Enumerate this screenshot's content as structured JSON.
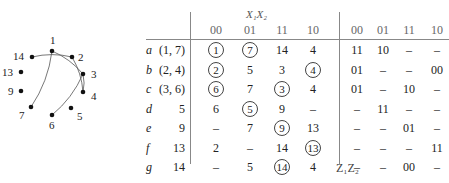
{
  "graph": {
    "nodes": [
      {
        "id": "1",
        "x": 52,
        "y": 51
      },
      {
        "id": "2",
        "x": 72,
        "y": 57
      },
      {
        "id": "3",
        "x": 83,
        "y": 74
      },
      {
        "id": "4",
        "x": 83,
        "y": 92
      },
      {
        "id": "5",
        "x": 71,
        "y": 108
      },
      {
        "id": "6",
        "x": 52,
        "y": 115
      },
      {
        "id": "7",
        "x": 31,
        "y": 107
      },
      {
        "id": "9",
        "x": 21,
        "y": 91
      },
      {
        "id": "13",
        "x": 21,
        "y": 72
      },
      {
        "id": "14",
        "x": 32,
        "y": 57
      }
    ],
    "edges": [
      [
        "1",
        "7"
      ],
      [
        "1",
        "3"
      ],
      [
        "14",
        "2"
      ],
      [
        "2",
        "4"
      ],
      [
        "3",
        "4"
      ],
      [
        "3",
        "6"
      ]
    ]
  },
  "table": {
    "group_header_x": "X₁X₂",
    "group_header_z": "Z₁Z₂",
    "x_columns": [
      "00",
      "01",
      "11",
      "10"
    ],
    "z_columns": [
      "00",
      "01",
      "11",
      "10"
    ],
    "rows": [
      {
        "label": "a",
        "states": "(1, 7)",
        "x": [
          {
            "v": "1",
            "c": true
          },
          {
            "v": "7",
            "c": true
          },
          {
            "v": "14",
            "c": false
          },
          {
            "v": "4",
            "c": false
          }
        ],
        "z": [
          "11",
          "10",
          "–",
          "–"
        ]
      },
      {
        "label": "b",
        "states": "(2, 4)",
        "x": [
          {
            "v": "2",
            "c": true
          },
          {
            "v": "5",
            "c": false
          },
          {
            "v": "3",
            "c": false
          },
          {
            "v": "4",
            "c": true
          }
        ],
        "z": [
          "01",
          "–",
          "–",
          "00"
        ]
      },
      {
        "label": "c",
        "states": "(3, 6)",
        "x": [
          {
            "v": "6",
            "c": true
          },
          {
            "v": "7",
            "c": false
          },
          {
            "v": "3",
            "c": true
          },
          {
            "v": "4",
            "c": false
          }
        ],
        "z": [
          "01",
          "–",
          "10",
          "–"
        ]
      },
      {
        "label": "d",
        "states": "5",
        "x": [
          {
            "v": "6",
            "c": false
          },
          {
            "v": "5",
            "c": true
          },
          {
            "v": "9",
            "c": false
          },
          {
            "v": "–",
            "c": false
          }
        ],
        "z": [
          "–",
          "11",
          "–",
          "–"
        ]
      },
      {
        "label": "e",
        "states": "9",
        "x": [
          {
            "v": "–",
            "c": false
          },
          {
            "v": "7",
            "c": false
          },
          {
            "v": "9",
            "c": true
          },
          {
            "v": "13",
            "c": false
          }
        ],
        "z": [
          "–",
          "–",
          "01",
          "–"
        ]
      },
      {
        "label": "f",
        "states": "13",
        "x": [
          {
            "v": "2",
            "c": false
          },
          {
            "v": "–",
            "c": false
          },
          {
            "v": "14",
            "c": false
          },
          {
            "v": "13",
            "c": true
          }
        ],
        "z": [
          "–",
          "–",
          "–",
          "11"
        ]
      },
      {
        "label": "g",
        "states": "14",
        "x": [
          {
            "v": "–",
            "c": false
          },
          {
            "v": "5",
            "c": false
          },
          {
            "v": "14",
            "c": true
          },
          {
            "v": "4",
            "c": false
          }
        ],
        "z": [
          "–",
          "–",
          "00",
          "–"
        ]
      }
    ]
  }
}
